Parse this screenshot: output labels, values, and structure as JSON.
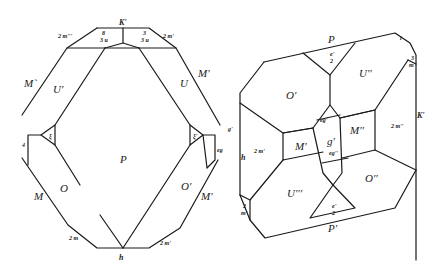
{
  "figure_left": {
    "faces": {
      "P": "P",
      "U_left": "U'",
      "U_right": "U",
      "M_upper_left": "M`",
      "M_upper_right": "M'",
      "M_lower_left": "M",
      "M_lower_right": "M'",
      "O_left": "O",
      "O_right": "O'",
      "top_vertex": "K'",
      "bottom_vertex": "h",
      "top_left_edge": "2 m'''",
      "top_right_edge": "2 m'",
      "top_inner_left": "8\n3 u",
      "top_inner_right": "3\n3 u",
      "bottom_left_edge": "2 m",
      "bottom_right_edge": "2 m'",
      "side_left_small": "ξ",
      "side_right_small": "ξ'",
      "side_left_tiny": "4",
      "side_right_tiny": "g'",
      "side_right_tiny2": "eg"
    }
  },
  "figure_right": {
    "faces": {
      "P_top": "P",
      "P_bottom": "P'",
      "O_top_left": "O'",
      "O_bottom_right": "O''",
      "U_top_right": "U''",
      "U_bottom_left": "U'''",
      "M_center_left": "M'",
      "M_center_right": "M''",
      "g_center": "g'",
      "e_top": "e'\n2",
      "e_bottom": "e'\n2",
      "eg_upper": "eg'",
      "eg_lower": "eg''",
      "m_left": "2 m'",
      "m_right": "2 m''",
      "k_right": "K'",
      "h_left": "h",
      "top_right_vertex": "i",
      "right_small": "3\nm",
      "left_small": "2\nm'"
    }
  }
}
